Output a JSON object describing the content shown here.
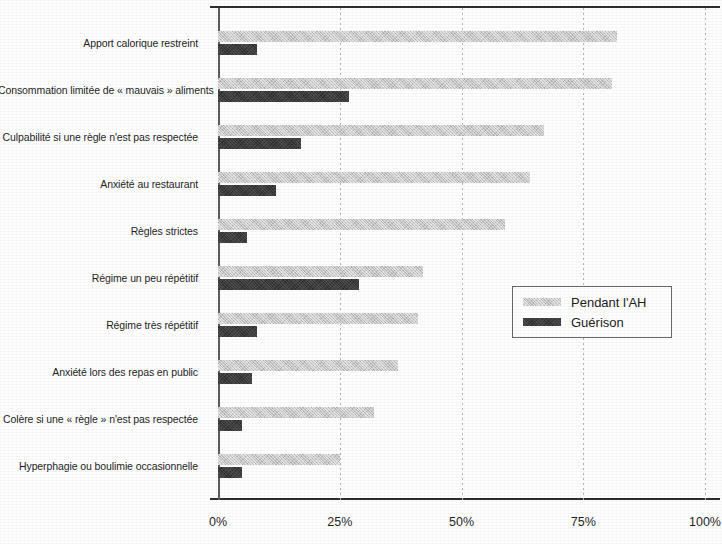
{
  "chart_data": {
    "type": "bar",
    "orientation": "horizontal",
    "title": "",
    "subtitle": "",
    "xlabel": "",
    "ylabel": "",
    "xlim": [
      0,
      100
    ],
    "xticks": [
      "0%",
      "25%",
      "50%",
      "75%",
      "100%"
    ],
    "xtick_values": [
      0,
      25,
      50,
      75,
      100
    ],
    "grid": "vertical-dotted",
    "legend_position": "middle-right",
    "categories": [
      "Apport calorique restreint",
      "Consommation limitée de « mauvais » aliments",
      "Culpabilité si une règle n'est pas respectée",
      "Anxiété au restaurant",
      "Règles strictes",
      "Régime un peu répétitif",
      "Régime très répétitif",
      "Anxiété lors des repas en public",
      "Colère si une « règle » n'est pas respectée",
      "Hyperphagie ou boulimie occasionnelle"
    ],
    "series": [
      {
        "name": "Pendant l'AH",
        "color": "#c8c8c8",
        "values": [
          82,
          81,
          67,
          64,
          59,
          42,
          41,
          37,
          32,
          25
        ]
      },
      {
        "name": "Guérison",
        "color": "#3b3b3b",
        "values": [
          8,
          27,
          17,
          12,
          6,
          29,
          8,
          7,
          5,
          5
        ]
      }
    ]
  },
  "legend": {
    "items": [
      {
        "label": "Pendant l'AH",
        "swatch": "light"
      },
      {
        "label": "Guérison",
        "swatch": "dark"
      }
    ]
  },
  "axis": {
    "x_tick_labels": [
      "0%",
      "25%",
      "50%",
      "75%",
      "100%"
    ]
  }
}
